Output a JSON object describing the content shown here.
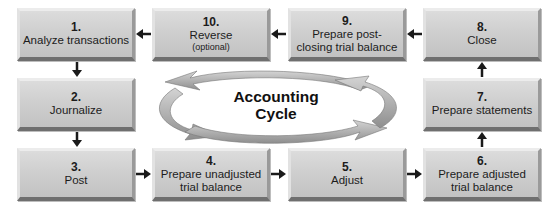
{
  "diagram": {
    "title": "Accounting Cycle",
    "center_label_line1": "Accounting",
    "center_label_line2": "Cycle",
    "colors": {
      "box_fill": "#cfcfcf",
      "box_shadow": "#6f6f6f",
      "arrow": "#1a1a1a",
      "cycle_arrows": "#a8a8a8"
    },
    "steps": [
      {
        "number": "1.",
        "label": "Analyze transactions",
        "note": ""
      },
      {
        "number": "2.",
        "label": "Journalize",
        "note": ""
      },
      {
        "number": "3.",
        "label": "Post",
        "note": ""
      },
      {
        "number": "4.",
        "label_line1": "Prepare unadjusted",
        "label_line2": "trial balance"
      },
      {
        "number": "5.",
        "label": "Adjust"
      },
      {
        "number": "6.",
        "label_line1": "Prepare adjusted",
        "label_line2": "trial balance"
      },
      {
        "number": "7.",
        "label": "Prepare statements"
      },
      {
        "number": "8.",
        "label": "Close"
      },
      {
        "number": "9.",
        "label_line1": "Prepare post-",
        "label_line2": "closing trial balance"
      },
      {
        "number": "10.",
        "label": "Reverse",
        "note": "(optional)"
      }
    ],
    "flow": [
      "1→2",
      "2→3",
      "3→4",
      "4→5",
      "5→6",
      "6→7",
      "7→8",
      "8→9",
      "9→10",
      "10→1"
    ]
  }
}
